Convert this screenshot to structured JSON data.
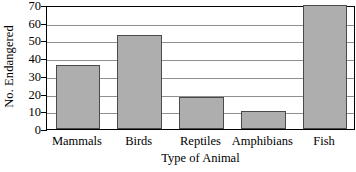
{
  "chart_data": {
    "type": "bar",
    "title": "",
    "xlabel": "Type of Animal",
    "ylabel": "No. Endangered",
    "categories": [
      "Mammals",
      "Birds",
      "Reptiles",
      "Amphibians",
      "Fish"
    ],
    "values": [
      36,
      53,
      18,
      10,
      70
    ],
    "ylim": [
      0,
      70
    ],
    "ytick_labels": [
      "0",
      "10",
      "20",
      "30",
      "40",
      "50",
      "60",
      "70"
    ],
    "ytick_values": [
      0,
      10,
      20,
      30,
      40,
      50,
      60,
      70
    ],
    "grid": true,
    "legend": "none",
    "bar_fill_color": "#aeaeae",
    "bar_edge_color": "#4a4a4a",
    "gridline_color": "#8f8f8f",
    "axis_color": "#000000"
  }
}
